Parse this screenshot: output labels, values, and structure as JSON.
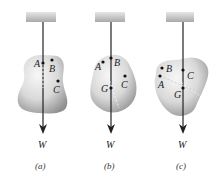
{
  "figure": {
    "panels": [
      {
        "id": "a",
        "caption": "(a)",
        "weight_label": "W",
        "points": [
          {
            "label": "A",
            "x": 43,
            "y": 63
          },
          {
            "label": "B",
            "x": 52,
            "y": 60
          },
          {
            "label": "C",
            "x": 58,
            "y": 81
          }
        ]
      },
      {
        "id": "b",
        "caption": "(b)",
        "weight_label": "W",
        "points": [
          {
            "label": "A",
            "x": 103,
            "y": 62
          },
          {
            "label": "B",
            "x": 111,
            "y": 58
          },
          {
            "label": "C",
            "x": 125,
            "y": 76
          },
          {
            "label": "G",
            "x": 111,
            "y": 88
          }
        ]
      },
      {
        "id": "c",
        "caption": "(c)",
        "weight_label": "W",
        "points": [
          {
            "label": "B",
            "x": 162,
            "y": 68
          },
          {
            "label": "A",
            "x": 160,
            "y": 76
          },
          {
            "label": "C",
            "x": 183,
            "y": 70
          },
          {
            "label": "G",
            "x": 183,
            "y": 88
          }
        ]
      }
    ],
    "colors": {
      "body_fill_light": "#f4f4f4",
      "body_fill_dark": "#9a9a9a",
      "ceiling": "#bdbdbd",
      "string": "#222222",
      "dashed": "#9a9a9a",
      "text": "#222222"
    }
  }
}
